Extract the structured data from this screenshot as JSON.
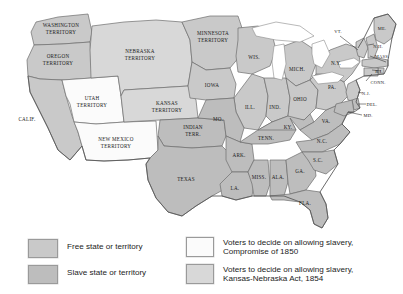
{
  "map": {
    "colors": {
      "free": "#c9c9c9",
      "slave": "#bdbdbd",
      "compromise_1850": "#fbfbfb",
      "kansas_nebraska_1854": "#d8d8d8",
      "water": "#ffffff",
      "border": "#6d6d6d",
      "background": "#ffffff"
    },
    "regions": [
      {
        "id": "washington-territory",
        "label": "WASHINGTON\nTERRITORY",
        "status": "free"
      },
      {
        "id": "oregon-territory",
        "label": "OREGON\nTERRITORY",
        "status": "free"
      },
      {
        "id": "utah-territory",
        "label": "UTAH\nTERRITORY",
        "status": "compromise_1850"
      },
      {
        "id": "new-mexico-territory",
        "label": "NEW MEXICO\nTERRITORY",
        "status": "compromise_1850"
      },
      {
        "id": "california",
        "label": "CALIF.",
        "status": "free"
      },
      {
        "id": "nebraska-territory",
        "label": "NEBRASKA\nTERRITORY",
        "status": "kansas_nebraska_1854"
      },
      {
        "id": "kansas-territory",
        "label": "KANSAS\nTERRITORY",
        "status": "kansas_nebraska_1854"
      },
      {
        "id": "minnesota-territory",
        "label": "MINNESOTA\nTERRITORY",
        "status": "free"
      },
      {
        "id": "indian-territory",
        "label": "INDIAN\nTERR.",
        "status": "slave"
      },
      {
        "id": "texas",
        "label": "TEXAS",
        "status": "slave"
      },
      {
        "id": "iowa",
        "label": "IOWA",
        "status": "free"
      },
      {
        "id": "wisconsin",
        "label": "WIS.",
        "status": "free"
      },
      {
        "id": "michigan",
        "label": "MICH.",
        "status": "free"
      },
      {
        "id": "illinois",
        "label": "ILL.",
        "status": "free"
      },
      {
        "id": "indiana",
        "label": "IND.",
        "status": "free"
      },
      {
        "id": "ohio",
        "label": "OHIO",
        "status": "free"
      },
      {
        "id": "missouri",
        "label": "MO.",
        "status": "slave"
      },
      {
        "id": "arkansas",
        "label": "ARK.",
        "status": "slave"
      },
      {
        "id": "louisiana",
        "label": "LA.",
        "status": "slave"
      },
      {
        "id": "mississippi",
        "label": "MISS.",
        "status": "slave"
      },
      {
        "id": "alabama",
        "label": "ALA.",
        "status": "slave"
      },
      {
        "id": "georgia",
        "label": "GA.",
        "status": "slave"
      },
      {
        "id": "florida",
        "label": "FLA.",
        "status": "slave"
      },
      {
        "id": "tennessee",
        "label": "TENN.",
        "status": "slave"
      },
      {
        "id": "kentucky",
        "label": "KY.",
        "status": "slave"
      },
      {
        "id": "virginia",
        "label": "VA.",
        "status": "slave"
      },
      {
        "id": "north-carolina",
        "label": "N.C.",
        "status": "slave"
      },
      {
        "id": "south-carolina",
        "label": "S.C.",
        "status": "slave"
      },
      {
        "id": "pennsylvania",
        "label": "PA.",
        "status": "free"
      },
      {
        "id": "new-york",
        "label": "N.Y.",
        "status": "free"
      },
      {
        "id": "vermont",
        "label": "VT.",
        "status": "free"
      },
      {
        "id": "maine",
        "label": "ME.",
        "status": "free"
      },
      {
        "id": "new-hampshire",
        "label": "N.H.",
        "status": "free"
      },
      {
        "id": "massachusetts",
        "label": "MASS.",
        "status": "free"
      },
      {
        "id": "rhode-island",
        "label": "R.I.",
        "status": "free"
      },
      {
        "id": "connecticut",
        "label": "CONN.",
        "status": "free"
      },
      {
        "id": "new-jersey",
        "label": "N.J.",
        "status": "free"
      },
      {
        "id": "delaware",
        "label": "DEL.",
        "status": "slave"
      },
      {
        "id": "maryland",
        "label": "MD.",
        "status": "slave"
      }
    ],
    "labels": {
      "washington_territory": "WASHINGTON",
      "washington_territory_2": "TERRITORY",
      "oregon_territory": "OREGON",
      "oregon_territory_2": "TERRITORY",
      "utah_territory": "UTAH",
      "utah_territory_2": "TERRITORY",
      "new_mexico_territory": "NEW MEXICO",
      "new_mexico_territory_2": "TERRITORY",
      "california": "CALIF.",
      "nebraska_territory": "NEBRASKA",
      "nebraska_territory_2": "TERRITORY",
      "kansas_territory": "KANSAS",
      "kansas_territory_2": "TERRITORY",
      "minnesota_territory": "MINNESOTA",
      "minnesota_territory_2": "TERRITORY",
      "indian_territory": "INDIAN",
      "indian_territory_2": "TERR.",
      "texas": "TEXAS",
      "iowa": "IOWA",
      "wisconsin": "WIS.",
      "michigan": "MICH.",
      "illinois": "ILL.",
      "indiana": "IND.",
      "ohio": "OHIO",
      "missouri": "MO.",
      "arkansas": "ARK.",
      "louisiana": "LA.",
      "mississippi": "MISS.",
      "alabama": "ALA.",
      "georgia": "GA.",
      "florida": "FLA.",
      "tennessee": "TENN.",
      "kentucky": "KY.",
      "virginia": "VA.",
      "north_carolina": "N.C.",
      "south_carolina": "S.C.",
      "pennsylvania": "PA.",
      "new_york": "N.Y.",
      "vermont": "VT.",
      "maine": "ME.",
      "new_hampshire": "N.H.",
      "massachusetts": "MASS.",
      "rhode_island": "R.I.",
      "connecticut": "CONN.",
      "new_jersey": "N.J.",
      "delaware": "DEL.",
      "maryland": "MD."
    }
  },
  "legend": {
    "left": [
      {
        "id": "free-state",
        "label": "Free state or territory",
        "swatch": "#c9c9c9"
      },
      {
        "id": "slave-state",
        "label": "Slave state or territory",
        "swatch": "#bdbdbd"
      }
    ],
    "right": [
      {
        "id": "compromise-1850",
        "label": "Voters to decide on allowing slavery,\nCompromise of 1850",
        "swatch": "#fbfbfb"
      },
      {
        "id": "kansas-nebraska-1854",
        "label": "Voters to decide on allowing slavery,\nKansas-Nebraska Act, 1854",
        "swatch": "#d8d8d8"
      }
    ]
  }
}
